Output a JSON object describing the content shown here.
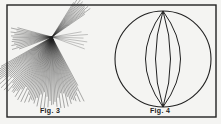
{
  "figures": [
    {
      "id": "fig3",
      "caption": "Fig. 3",
      "description": "fan of hatched lines radiating from a single point"
    },
    {
      "id": "fig4",
      "caption": "Fig. 4",
      "description": "circle divided by meridian arcs meeting at top and bottom poles"
    }
  ],
  "colors": {
    "ink": "#222222",
    "paper": "#f4f4f2"
  }
}
